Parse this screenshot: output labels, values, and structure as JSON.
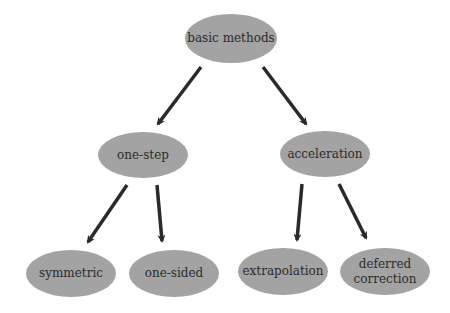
{
  "diagram": {
    "root": {
      "label": "basic methods"
    },
    "level1": [
      {
        "label": "one-step"
      },
      {
        "label": "acceleration"
      }
    ],
    "level2": [
      {
        "label": "symmetric",
        "parent": "one-step"
      },
      {
        "label": "one-sided",
        "parent": "one-step"
      },
      {
        "label": "extrapolation",
        "parent": "acceleration"
      },
      {
        "label": "deferred correction",
        "parent": "acceleration"
      }
    ],
    "colors": {
      "node_fill": "#a3a3a3",
      "arrow": "#2a2a2a",
      "text": "#2a2a2a"
    }
  }
}
